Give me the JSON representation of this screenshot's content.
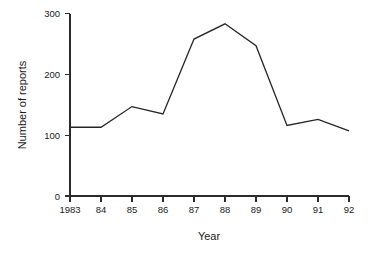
{
  "chart_data": {
    "type": "line",
    "title": "",
    "xlabel": "Year",
    "ylabel": "Number of reports",
    "categories": [
      "1983",
      "84",
      "85",
      "86",
      "87",
      "88",
      "89",
      "90",
      "91",
      "92"
    ],
    "x": [
      1983,
      1984,
      1985,
      1986,
      1987,
      1988,
      1989,
      1990,
      1991,
      1992
    ],
    "values": [
      113,
      113,
      147,
      135,
      258,
      283,
      247,
      116,
      126,
      107
    ],
    "series": [
      {
        "name": "Number of reports",
        "values": [
          113,
          113,
          147,
          135,
          258,
          283,
          247,
          116,
          126,
          107
        ]
      }
    ],
    "ylim": [
      0,
      300
    ],
    "yticks": [
      0,
      100,
      200,
      300
    ],
    "ytick_labels": [
      "0",
      "100",
      "200",
      "300"
    ],
    "xtick_labels": [
      "1983",
      "84",
      "85",
      "86",
      "87",
      "88",
      "89",
      "90",
      "91",
      "92"
    ],
    "grid": false,
    "legend": false,
    "line_color": "#262626",
    "axis_color": "#2b2b2b",
    "background_color": "#ffffff"
  },
  "axes": {
    "y_title": "Number of reports",
    "x_title": "Year"
  },
  "y_ticks": [
    {
      "label": "300",
      "value": 300
    },
    {
      "label": "200",
      "value": 200
    },
    {
      "label": "100",
      "value": 100
    },
    {
      "label": "0",
      "value": 0
    }
  ],
  "x_ticks": [
    {
      "label": "1983",
      "value": 1983
    },
    {
      "label": "84",
      "value": 1984
    },
    {
      "label": "85",
      "value": 1985
    },
    {
      "label": "86",
      "value": 1986
    },
    {
      "label": "87",
      "value": 1987
    },
    {
      "label": "88",
      "value": 1988
    },
    {
      "label": "89",
      "value": 1989
    },
    {
      "label": "90",
      "value": 1990
    },
    {
      "label": "91",
      "value": 1991
    },
    {
      "label": "92",
      "value": 1992
    }
  ]
}
